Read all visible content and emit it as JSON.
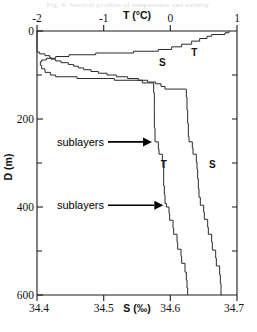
{
  "figure": {
    "header_text": "Fig. 4. Vertical profiles of temperature and salinity",
    "caption_visible": false
  },
  "chart_data": {
    "type": "line",
    "title": "",
    "orientation": "vertical-profile",
    "ylabel": "D (m)",
    "ylim": [
      0,
      600
    ],
    "y_inverted": true,
    "y_major_ticks": [
      0,
      200,
      400,
      600
    ],
    "y_minor_ticks": [
      100,
      300,
      500
    ],
    "y_tick_labels": [
      "0",
      "200",
      "400",
      "600"
    ],
    "top_axis": {
      "label": "T (°C)",
      "range": [
        -2,
        1
      ],
      "ticks": [
        -2,
        -1,
        0,
        1
      ],
      "tick_labels": [
        "-2",
        "-1",
        "0",
        "1"
      ]
    },
    "bottom_axis": {
      "label": "S (‰)",
      "range": [
        34.4,
        34.7
      ],
      "ticks": [
        34.4,
        34.5,
        34.6,
        34.7
      ],
      "tick_labels": [
        "34.4",
        "34.5",
        "34.6",
        "34.7"
      ]
    },
    "grid": false,
    "legend": "inline-curve-labels",
    "series": [
      {
        "name": "T",
        "axis": "top",
        "unit": "°C",
        "label_positions": [
          {
            "text": "T",
            "x_units": 0.36,
            "depth_m": 57
          },
          {
            "text": "T",
            "x_units": -0.1,
            "depth_m": 312
          }
        ],
        "points": [
          {
            "depth_m": 0,
            "value": 0.88
          },
          {
            "depth_m": 4,
            "value": 0.82
          },
          {
            "depth_m": 8,
            "value": 0.62
          },
          {
            "depth_m": 12,
            "value": 0.55
          },
          {
            "depth_m": 17,
            "value": 0.44
          },
          {
            "depth_m": 23,
            "value": 0.32
          },
          {
            "depth_m": 30,
            "value": 0.17
          },
          {
            "depth_m": 36,
            "value": 0.02
          },
          {
            "depth_m": 42,
            "value": -0.18
          },
          {
            "depth_m": 46,
            "value": -0.55
          },
          {
            "depth_m": 50,
            "value": -1.12
          },
          {
            "depth_m": 54,
            "value": -1.52
          },
          {
            "depth_m": 58,
            "value": -1.72
          },
          {
            "depth_m": 62,
            "value": -1.86
          },
          {
            "depth_m": 66,
            "value": -1.93
          },
          {
            "depth_m": 70,
            "value": -1.95
          },
          {
            "depth_m": 78,
            "value": -1.93
          },
          {
            "depth_m": 86,
            "value": -1.88
          },
          {
            "depth_m": 94,
            "value": -1.8
          },
          {
            "depth_m": 100,
            "value": -1.72
          },
          {
            "depth_m": 104,
            "value": -1.4
          },
          {
            "depth_m": 108,
            "value": -0.84
          },
          {
            "depth_m": 112,
            "value": -0.42
          },
          {
            "depth_m": 118,
            "value": -0.25
          },
          {
            "depth_m": 140,
            "value": -0.24
          },
          {
            "depth_m": 180,
            "value": -0.24
          },
          {
            "depth_m": 220,
            "value": -0.23
          },
          {
            "depth_m": 243,
            "value": -0.23
          },
          {
            "depth_m": 252,
            "value": -0.18
          },
          {
            "depth_m": 268,
            "value": -0.17
          },
          {
            "depth_m": 280,
            "value": -0.12
          },
          {
            "depth_m": 296,
            "value": -0.11
          },
          {
            "depth_m": 310,
            "value": -0.1
          },
          {
            "depth_m": 330,
            "value": -0.1
          },
          {
            "depth_m": 352,
            "value": -0.09
          },
          {
            "depth_m": 372,
            "value": -0.08
          },
          {
            "depth_m": 392,
            "value": -0.06
          },
          {
            "depth_m": 400,
            "value": -0.02
          },
          {
            "depth_m": 414,
            "value": -0.01
          },
          {
            "depth_m": 430,
            "value": 0.04
          },
          {
            "depth_m": 448,
            "value": 0.05
          },
          {
            "depth_m": 462,
            "value": 0.1
          },
          {
            "depth_m": 480,
            "value": 0.11
          },
          {
            "depth_m": 496,
            "value": 0.16
          },
          {
            "depth_m": 512,
            "value": 0.17
          },
          {
            "depth_m": 528,
            "value": 0.22
          },
          {
            "depth_m": 548,
            "value": 0.24
          },
          {
            "depth_m": 566,
            "value": 0.25
          },
          {
            "depth_m": 584,
            "value": 0.26
          },
          {
            "depth_m": 600,
            "value": 0.26
          }
        ]
      },
      {
        "name": "S",
        "axis": "bottom",
        "unit": "‰",
        "label_positions": [
          {
            "text": "S",
            "x_units": 34.588,
            "depth_m": 80
          },
          {
            "text": "S",
            "x_units": 34.663,
            "depth_m": 312
          }
        ],
        "points": [
          {
            "depth_m": 0,
            "value": 34.4
          },
          {
            "depth_m": 44,
            "value": 34.4
          },
          {
            "depth_m": 48,
            "value": 34.404
          },
          {
            "depth_m": 52,
            "value": 34.412
          },
          {
            "depth_m": 56,
            "value": 34.419
          },
          {
            "depth_m": 60,
            "value": 34.421
          },
          {
            "depth_m": 64,
            "value": 34.428
          },
          {
            "depth_m": 68,
            "value": 34.436
          },
          {
            "depth_m": 72,
            "value": 34.447
          },
          {
            "depth_m": 76,
            "value": 34.455
          },
          {
            "depth_m": 80,
            "value": 34.462
          },
          {
            "depth_m": 84,
            "value": 34.47
          },
          {
            "depth_m": 88,
            "value": 34.481
          },
          {
            "depth_m": 92,
            "value": 34.492
          },
          {
            "depth_m": 96,
            "value": 34.505
          },
          {
            "depth_m": 100,
            "value": 34.519
          },
          {
            "depth_m": 104,
            "value": 34.536
          },
          {
            "depth_m": 108,
            "value": 34.552
          },
          {
            "depth_m": 112,
            "value": 34.566
          },
          {
            "depth_m": 116,
            "value": 34.578
          },
          {
            "depth_m": 120,
            "value": 34.586
          },
          {
            "depth_m": 126,
            "value": 34.592
          },
          {
            "depth_m": 132,
            "value": 34.624
          },
          {
            "depth_m": 150,
            "value": 34.625
          },
          {
            "depth_m": 180,
            "value": 34.626
          },
          {
            "depth_m": 210,
            "value": 34.627
          },
          {
            "depth_m": 240,
            "value": 34.628
          },
          {
            "depth_m": 252,
            "value": 34.633
          },
          {
            "depth_m": 266,
            "value": 34.634
          },
          {
            "depth_m": 280,
            "value": 34.639
          },
          {
            "depth_m": 298,
            "value": 34.64
          },
          {
            "depth_m": 314,
            "value": 34.641
          },
          {
            "depth_m": 336,
            "value": 34.642
          },
          {
            "depth_m": 358,
            "value": 34.643
          },
          {
            "depth_m": 378,
            "value": 34.645
          },
          {
            "depth_m": 396,
            "value": 34.65
          },
          {
            "depth_m": 412,
            "value": 34.651
          },
          {
            "depth_m": 428,
            "value": 34.656
          },
          {
            "depth_m": 446,
            "value": 34.657
          },
          {
            "depth_m": 462,
            "value": 34.662
          },
          {
            "depth_m": 480,
            "value": 34.663
          },
          {
            "depth_m": 498,
            "value": 34.668
          },
          {
            "depth_m": 516,
            "value": 34.669
          },
          {
            "depth_m": 534,
            "value": 34.674
          },
          {
            "depth_m": 554,
            "value": 34.675
          },
          {
            "depth_m": 574,
            "value": 34.676
          },
          {
            "depth_m": 600,
            "value": 34.677
          }
        ]
      }
    ],
    "annotations": [
      {
        "text": "sublayers",
        "depth_m": 252,
        "arrow": "right",
        "target_series": "T"
      },
      {
        "text": "sublayers",
        "depth_m": 396,
        "arrow": "right",
        "target_series": "T"
      }
    ]
  }
}
